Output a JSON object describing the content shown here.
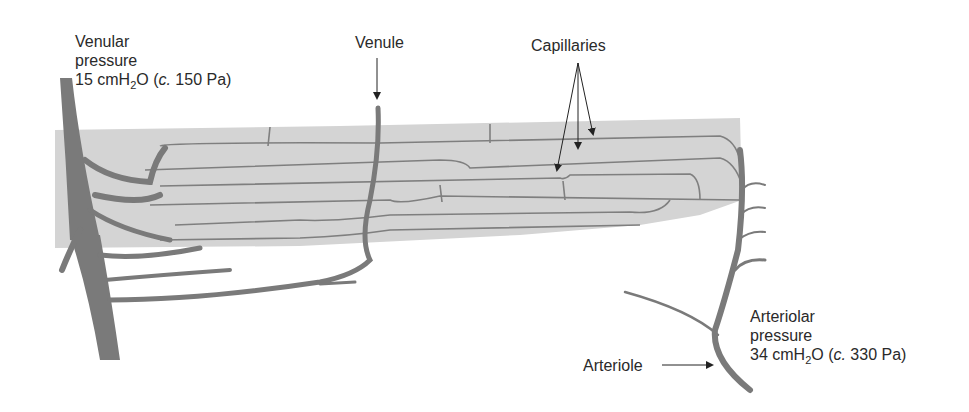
{
  "diagram": {
    "type": "capillary-bed",
    "colors": {
      "vessel": "#7a7a7a",
      "tissue": "#d4d4d4",
      "capillary_line": "#7f7f7f",
      "text": "#2a2a2a",
      "arrow": "#222222"
    },
    "labels": {
      "venular_pressure": {
        "line1": "Venular",
        "line2": "pressure",
        "value_prefix": "15 cmH",
        "sub": "2",
        "value_mid": "O (",
        "approx": "c.",
        "value_suffix": " 150 Pa)"
      },
      "venule": "Venule",
      "capillaries": "Capillaries",
      "arteriolar_pressure": {
        "line1": "Arteriolar",
        "line2": "pressure",
        "value_prefix": "34 cmH",
        "sub": "2",
        "value_mid": "O (",
        "approx": "c.",
        "value_suffix": " 330 Pa)"
      },
      "arteriole": "Arteriole"
    }
  }
}
